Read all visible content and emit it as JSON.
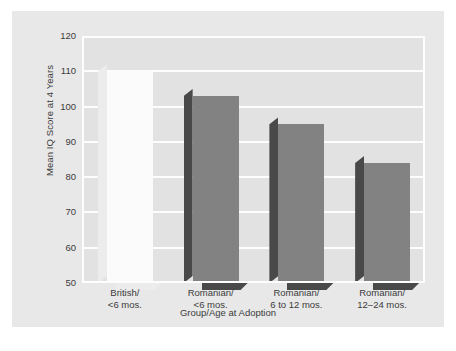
{
  "chart_data": {
    "type": "bar",
    "title": "",
    "xlabel": "Group/Age at Adoption",
    "ylabel": "Mean IQ Score at 4 Years",
    "categories": [
      "British/\n<6 mos.",
      "Romanian/\n<6 mos.",
      "Romanian/\n6 to 12 mos.",
      "Romanian/\n12–24 mos."
    ],
    "category_lines": [
      [
        "British/",
        "<6 mos."
      ],
      [
        "Romanian/",
        "<6 mos."
      ],
      [
        "Romanian/",
        "6 to 12 mos."
      ],
      [
        "Romanian/",
        "12–24 mos."
      ]
    ],
    "values": [
      110,
      103,
      95,
      84
    ],
    "ylim": [
      50,
      120
    ],
    "yticks": [
      120,
      110,
      100,
      90,
      80,
      70,
      60,
      50
    ],
    "ytick_labels": [
      "120",
      "110",
      "100",
      "90",
      "80",
      "70",
      "60",
      "50"
    ],
    "grid": true,
    "grid_color": "#fdfdfd",
    "legend": null,
    "bar_styles": [
      "light",
      "dark",
      "dark",
      "dark"
    ],
    "colors": {
      "bar_light_face": "#fbfbfb",
      "bar_light_side": "#ececec",
      "bar_dark_face": "#828282",
      "bar_dark_side": "#494949",
      "plot_background": "#e2e2e2",
      "figure_background": "#e8e8e8",
      "text": "#3b3b3b"
    }
  },
  "axis": {
    "y_title": "Mean IQ Score at 4 Years",
    "x_title": "Group/Age at Adoption",
    "y_ticks": [
      "120",
      "110",
      "100",
      "90",
      "80",
      "70",
      "60",
      "50"
    ]
  }
}
